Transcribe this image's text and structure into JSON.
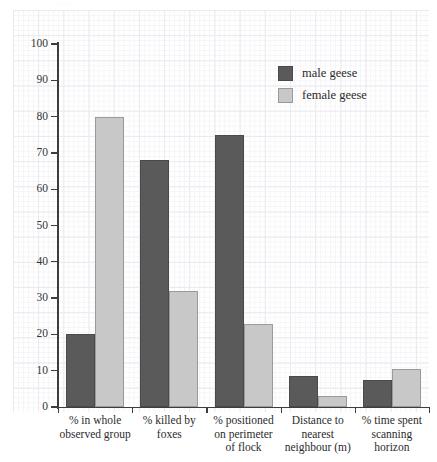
{
  "top_caption_stub": "····",
  "chart_data": {
    "type": "bar",
    "title": "",
    "subtitle": "",
    "xlabel": "",
    "ylabel": "",
    "ylim": [
      0,
      100
    ],
    "ytick_step": 10,
    "yticks": [
      "0",
      "10",
      "20",
      "30",
      "40",
      "50",
      "60",
      "70",
      "80",
      "90",
      "100"
    ],
    "grid": true,
    "grid_style": "graph-paper",
    "legend_position": "upper-right-inside",
    "categories": [
      "%  in whole observed group",
      "% killed by foxes",
      "% positioned on perimeter of flock",
      "Distance to nearest neighbour (m)",
      "% time spent scanning horizon"
    ],
    "category_lines": [
      [
        "%  in whole",
        "observed group"
      ],
      [
        "% killed by",
        "foxes"
      ],
      [
        "% positioned",
        "on perimeter",
        "of flock"
      ],
      [
        "Distance to",
        "nearest",
        "neighbour (m)"
      ],
      [
        "% time spent",
        "scanning",
        "horizon"
      ]
    ],
    "series": [
      {
        "name": "male geese",
        "color": "#5a5a5a",
        "values": [
          20,
          68,
          75,
          8.5,
          7.5
        ]
      },
      {
        "name": "female geese",
        "color": "#c8c8c8",
        "values": [
          80,
          32,
          23,
          3,
          10.5
        ]
      }
    ]
  },
  "legend": {
    "items": [
      {
        "label": "male geese",
        "color": "#5a5a5a"
      },
      {
        "label": "female geese",
        "color": "#c8c8c8"
      }
    ]
  },
  "axes": {
    "y_tick_labels": [
      "100",
      "90",
      "80",
      "70",
      "60",
      "50",
      "40",
      "30",
      "20",
      "10",
      "0"
    ]
  }
}
